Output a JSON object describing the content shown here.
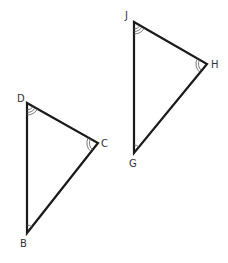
{
  "diagram": {
    "triangles": [
      {
        "name": "triangle-BCD",
        "vertices": [
          {
            "label": "D",
            "x": 27,
            "y": 103,
            "arcs": 3
          },
          {
            "label": "C",
            "x": 98,
            "y": 143,
            "arcs": 2
          },
          {
            "label": "B",
            "x": 27,
            "y": 233,
            "arcs": 1
          }
        ]
      },
      {
        "name": "triangle-GHJ",
        "vertices": [
          {
            "label": "J",
            "x": 134,
            "y": 22,
            "arcs": 3
          },
          {
            "label": "H",
            "x": 207,
            "y": 64,
            "arcs": 2
          },
          {
            "label": "G",
            "x": 134,
            "y": 153,
            "arcs": 1
          }
        ]
      }
    ],
    "labels": {
      "D": "D",
      "C": "C",
      "B": "B",
      "J": "J",
      "H": "H",
      "G": "G"
    },
    "stroke_color": "#1a1a1a"
  }
}
